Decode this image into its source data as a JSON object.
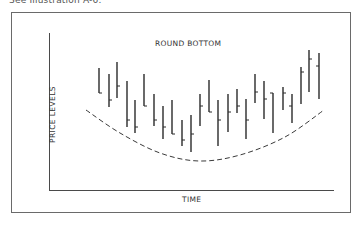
{
  "caption": "See Illustration A-6.",
  "chart_data": {
    "type": "bar",
    "subtype": "ohlc-bar (high-low-close)",
    "title": "ROUND BOTTOM",
    "xlabel": "TIME",
    "ylabel": "PRICE LEVELS",
    "grid": false,
    "legend": null,
    "axis_ticks": "none",
    "note": "Values are relative price levels (0 = x-axis, higher = higher price) estimated from pixel positions.",
    "categories": [
      1,
      2,
      3,
      4,
      5,
      6,
      7,
      8,
      9,
      10,
      11,
      12,
      13,
      14,
      15,
      16,
      17,
      18,
      19,
      20,
      21,
      22,
      23,
      24,
      25
    ],
    "series": [
      {
        "name": "high",
        "values": [
          122,
          116,
          128,
          109,
          90,
          116,
          96,
          84,
          90,
          70,
          75,
          96,
          110,
          90,
          96,
          101,
          91,
          116,
          109,
          97,
          103,
          96,
          123,
          140,
          137
        ]
      },
      {
        "name": "low",
        "values": [
          97,
          83,
          92,
          63,
          57,
          84,
          64,
          51,
          56,
          44,
          38,
          64,
          78,
          44,
          58,
          77,
          51,
          87,
          71,
          57,
          80,
          67,
          86,
          98,
          91
        ]
      },
      {
        "name": "close",
        "values": [
          97,
          90,
          104,
          70,
          63,
          84,
          70,
          63,
          56,
          50,
          56,
          84,
          78,
          70,
          78,
          84,
          70,
          98,
          91,
          97,
          97,
          84,
          118,
          131,
          124
        ]
      }
    ],
    "overlay": {
      "type": "dashed-curve",
      "label": "rounded bottom trend",
      "points": [
        [
          86,
          110
        ],
        [
          120,
          133
        ],
        [
          160,
          153
        ],
        [
          199,
          161
        ],
        [
          240,
          155
        ],
        [
          285,
          137
        ],
        [
          324,
          110
        ]
      ]
    },
    "bars_px": [
      {
        "x": 99,
        "high": 68,
        "low": 93,
        "close": 93,
        "tick": "right"
      },
      {
        "x": 109,
        "high": 74,
        "low": 107,
        "close": 100,
        "tick": "right"
      },
      {
        "x": 117,
        "high": 62,
        "low": 98,
        "close": 86,
        "tick": "right"
      },
      {
        "x": 127,
        "high": 81,
        "low": 127,
        "close": 120,
        "tick": "right"
      },
      {
        "x": 135,
        "high": 100,
        "low": 133,
        "close": 127,
        "tick": "right"
      },
      {
        "x": 144,
        "high": 74,
        "low": 106,
        "close": 106,
        "tick": "right"
      },
      {
        "x": 154,
        "high": 94,
        "low": 126,
        "close": 120,
        "tick": "right"
      },
      {
        "x": 163,
        "high": 106,
        "low": 139,
        "close": 127,
        "tick": "right"
      },
      {
        "x": 172,
        "high": 100,
        "low": 134,
        "close": 134,
        "tick": "right"
      },
      {
        "x": 182,
        "high": 120,
        "low": 146,
        "close": 140,
        "tick": "right"
      },
      {
        "x": 191,
        "high": 115,
        "low": 152,
        "close": 134,
        "tick": "right"
      },
      {
        "x": 200,
        "high": 94,
        "low": 126,
        "close": 106,
        "tick": "right"
      },
      {
        "x": 209,
        "high": 80,
        "low": 112,
        "close": 112,
        "tick": "right"
      },
      {
        "x": 218,
        "high": 100,
        "low": 146,
        "close": 120,
        "tick": "right"
      },
      {
        "x": 228,
        "high": 94,
        "low": 132,
        "close": 112,
        "tick": "right"
      },
      {
        "x": 237,
        "high": 89,
        "low": 113,
        "close": 106,
        "tick": "right"
      },
      {
        "x": 246,
        "high": 99,
        "low": 139,
        "close": 120,
        "tick": "right"
      },
      {
        "x": 255,
        "high": 74,
        "low": 103,
        "close": 92,
        "tick": "right"
      },
      {
        "x": 264,
        "high": 81,
        "low": 119,
        "close": 99,
        "tick": "right"
      },
      {
        "x": 273,
        "high": 93,
        "low": 133,
        "close": 93,
        "tick": "left"
      },
      {
        "x": 283,
        "high": 87,
        "low": 110,
        "close": 93,
        "tick": "right"
      },
      {
        "x": 292,
        "high": 94,
        "low": 123,
        "close": 106,
        "tick": "left"
      },
      {
        "x": 301,
        "high": 67,
        "low": 104,
        "close": 72,
        "tick": "right"
      },
      {
        "x": 309,
        "high": 50,
        "low": 92,
        "close": 59,
        "tick": "right"
      },
      {
        "x": 319,
        "high": 53,
        "low": 99,
        "close": 66,
        "tick": "left"
      }
    ]
  },
  "colors": {
    "ink": "#2a2a2a",
    "frame": "#6a6a6a",
    "background": "#ffffff"
  }
}
